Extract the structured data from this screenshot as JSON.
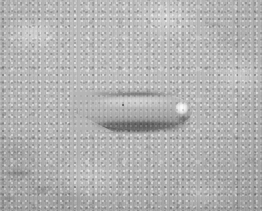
{
  "image": {
    "kind": "photograph",
    "mode": "grayscale",
    "width": 266,
    "height": 215,
    "caption": "",
    "subject": {
      "name": "elongated tapered grey object",
      "description": "A single smooth, elongated ovoid object lying horizontally, tapering to a soft point on the left and ending in a blunt rounded tip on the right, which carries a bright white specular highlight.",
      "orientation": "horizontal, long axis left-to-right, tail slightly lower on the left",
      "bounding_box": {
        "x": 78,
        "y": 92,
        "width": 114,
        "height": 38
      },
      "surface_marks": [
        {
          "name": "dark-speck",
          "x": 122,
          "y": 105,
          "size": 2
        }
      ],
      "highlights": [
        {
          "name": "tip-specular-highlight",
          "x": 177,
          "y": 101,
          "width": 16,
          "height": 17,
          "color": "#fdfdfd"
        },
        {
          "name": "upper-flank-sheen",
          "x": 92,
          "y": 97,
          "width": 86,
          "height": 9
        }
      ]
    },
    "background": {
      "name": "mottled grey stone surface",
      "description": "Speckled, granular light-grey surface resembling concrete or granite, with faint vertical scan striping and darker smudges toward the lower left.",
      "base_color": "#b6b6b6",
      "light_speckle_color": "#e8e8e8",
      "dark_speckle_color": "#7a7a7a"
    },
    "shadow": {
      "name": "cast shadow",
      "description": "Soft dark shadow pooling just left of the tapered tail and a darker contact line running beneath the full length of the object.",
      "color": "#4a4a4a"
    },
    "colors": {
      "background_mid_grey": "#b6b6b6",
      "object_body_grey": "#a6a6a6",
      "object_shade_grey": "#6d6d6d",
      "object_highlight_white": "#fdfdfd",
      "shadow_dark_grey": "#4a4a4a",
      "page_margin_white": "#ffffff"
    },
    "margins": {
      "name": "white page margin",
      "right_width": 4,
      "bottom_height": 4,
      "color": "#ffffff"
    }
  }
}
